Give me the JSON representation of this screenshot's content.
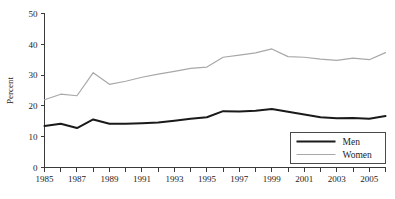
{
  "chart_data": {
    "type": "line",
    "title": "",
    "xlabel": "",
    "ylabel": "Percent",
    "xlim": [
      1985,
      2006
    ],
    "ylim": [
      0,
      50
    ],
    "grid": false,
    "legend_position": "bottom-right",
    "x": [
      1985,
      1986,
      1987,
      1988,
      1989,
      1990,
      1991,
      1992,
      1993,
      1994,
      1995,
      1996,
      1997,
      1998,
      1999,
      2000,
      2001,
      2002,
      2003,
      2004,
      2005,
      2006
    ],
    "x_tick_labels": [
      "1985",
      "1987",
      "1989",
      "1991",
      "1993",
      "1995",
      "1997",
      "1999",
      "2001",
      "2003",
      "2005"
    ],
    "x_tick_values": [
      1985,
      1987,
      1989,
      1991,
      1993,
      1995,
      1997,
      1999,
      2001,
      2003,
      2005
    ],
    "y_tick_labels": [
      "0",
      "10",
      "20",
      "30",
      "40",
      "50"
    ],
    "y_tick_values": [
      0,
      10,
      20,
      30,
      40,
      50
    ],
    "series": [
      {
        "name": "Men",
        "color": "#1a1a1a",
        "line_width": 2.0,
        "values": [
          13.5,
          14.2,
          12.8,
          15.6,
          14.2,
          14.2,
          14.4,
          14.6,
          15.2,
          15.8,
          16.3,
          18.3,
          18.2,
          18.4,
          19.0,
          18.1,
          17.2,
          16.3,
          16.0,
          16.1,
          15.8,
          16.7
        ]
      },
      {
        "name": "Women",
        "color": "#a8a8a8",
        "line_width": 1.2,
        "values": [
          22.0,
          23.8,
          23.3,
          30.8,
          27.0,
          28.0,
          29.3,
          30.3,
          31.2,
          32.2,
          32.6,
          35.8,
          36.5,
          37.2,
          38.5,
          36.0,
          35.8,
          35.2,
          34.8,
          35.5,
          35.0,
          37.3
        ]
      }
    ]
  },
  "legend": {
    "entries": [
      {
        "label": "Men"
      },
      {
        "label": "Women"
      }
    ]
  }
}
